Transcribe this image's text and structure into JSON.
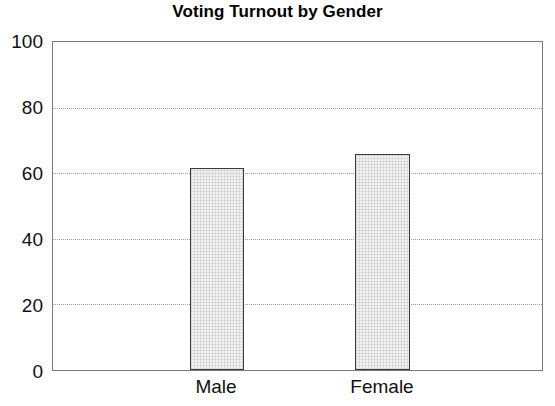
{
  "chart_data": {
    "type": "bar",
    "title": "Voting Turnout by Gender",
    "xlabel": "",
    "ylabel": "",
    "categories": [
      "Male",
      "Female"
    ],
    "values": [
      61.5,
      66
    ],
    "ylim": [
      0,
      100
    ],
    "yticks": [
      0,
      20,
      40,
      60,
      80,
      100
    ],
    "ytick_labels": [
      "0",
      "20",
      "40",
      "60",
      "80",
      "100"
    ],
    "gridlines": [
      20,
      40,
      60,
      80
    ],
    "grid": true,
    "legend": null,
    "legend_position": "none",
    "series": [
      {
        "name": "Voting Turnout",
        "values": [
          61.5,
          66
        ]
      }
    ],
    "colors": {
      "bar_fill": "#f2f2f2",
      "bar_border": "#3a3a3a",
      "axis": "#7a7a7a",
      "grid": "#9b9b9b",
      "text": "#111111",
      "background": "#ffffff"
    }
  },
  "axis": {
    "y_tick_0": "0",
    "y_tick_1": "20",
    "y_tick_2": "40",
    "y_tick_3": "60",
    "y_tick_4": "80",
    "y_tick_5": "100",
    "x_tick_0": "Male",
    "x_tick_1": "Female"
  }
}
